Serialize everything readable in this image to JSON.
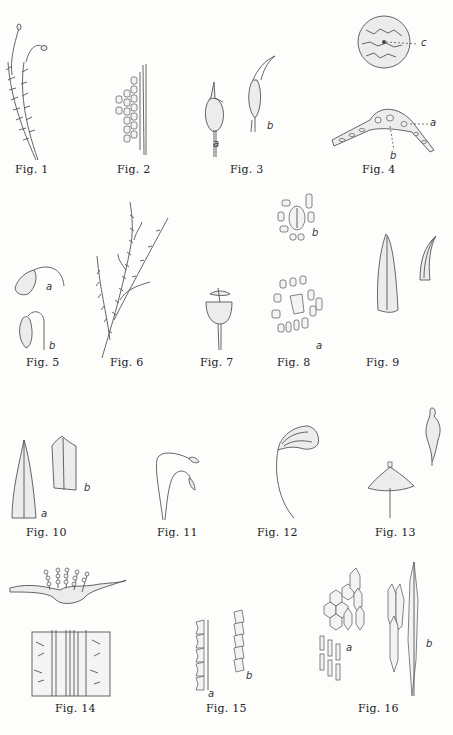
{
  "plate": {
    "figures": [
      {
        "id": 1,
        "label": "Fig. 1",
        "sublabels": []
      },
      {
        "id": 2,
        "label": "Fig. 2",
        "sublabels": []
      },
      {
        "id": 3,
        "label": "Fig. 3",
        "sublabels": [
          "a",
          "b"
        ]
      },
      {
        "id": 4,
        "label": "Fig. 4",
        "sublabels": [
          "c",
          "a",
          "b"
        ]
      },
      {
        "id": 5,
        "label": "Fig. 5",
        "sublabels": [
          "a",
          "b"
        ]
      },
      {
        "id": 6,
        "label": "Fig. 6",
        "sublabels": []
      },
      {
        "id": 7,
        "label": "Fig. 7",
        "sublabels": []
      },
      {
        "id": 8,
        "label": "Fig. 8",
        "sublabels": [
          "b",
          "a"
        ]
      },
      {
        "id": 9,
        "label": "Fig. 9",
        "sublabels": []
      },
      {
        "id": 10,
        "label": "Fig. 10",
        "sublabels": [
          "a",
          "b"
        ]
      },
      {
        "id": 11,
        "label": "Fig. 11",
        "sublabels": []
      },
      {
        "id": 12,
        "label": "Fig. 12",
        "sublabels": []
      },
      {
        "id": 13,
        "label": "Fig. 13",
        "sublabels": []
      },
      {
        "id": 14,
        "label": "Fig. 14",
        "sublabels": []
      },
      {
        "id": 15,
        "label": "Fig. 15",
        "sublabels": [
          "a",
          "b"
        ]
      },
      {
        "id": 16,
        "label": "Fig. 16",
        "sublabels": [
          "a",
          "b"
        ]
      }
    ]
  }
}
